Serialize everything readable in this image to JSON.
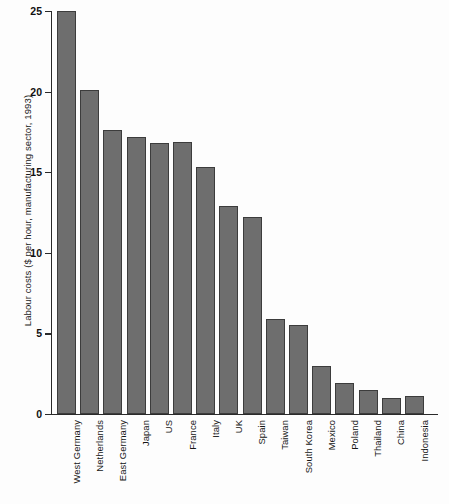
{
  "chart_data": {
    "type": "bar",
    "title": "",
    "subtitle": "",
    "xlabel": "",
    "ylabel": "Labour costs ($ per hour, manufacturing sector, 1993)",
    "ylim": [
      0,
      25
    ],
    "yticks": [
      0,
      5,
      10,
      15,
      20,
      25
    ],
    "ytick_labels": [
      "0",
      "5",
      "10",
      "15",
      "20",
      "25"
    ],
    "grid": false,
    "legend": null,
    "orientation": "vertical",
    "bar_color": "#6e6e6e",
    "bar_edge_color": "#3c3c3c",
    "background_color": "#fdfdfd",
    "axis_color": "#2a2a2a",
    "categories": [
      "West Germany",
      "Netherlands",
      "East Germany",
      "Japan",
      "US",
      "France",
      "Italy",
      "UK",
      "Spain",
      "Taiwan",
      "South Korea",
      "Mexico",
      "Poland",
      "Thailand",
      "China",
      "Indonesia"
    ],
    "values": [
      25.0,
      20.1,
      17.6,
      17.2,
      16.8,
      16.9,
      15.3,
      12.9,
      12.2,
      5.9,
      5.5,
      3.0,
      1.9,
      1.5,
      1.0,
      1.1
    ],
    "units": "$ per hour"
  }
}
